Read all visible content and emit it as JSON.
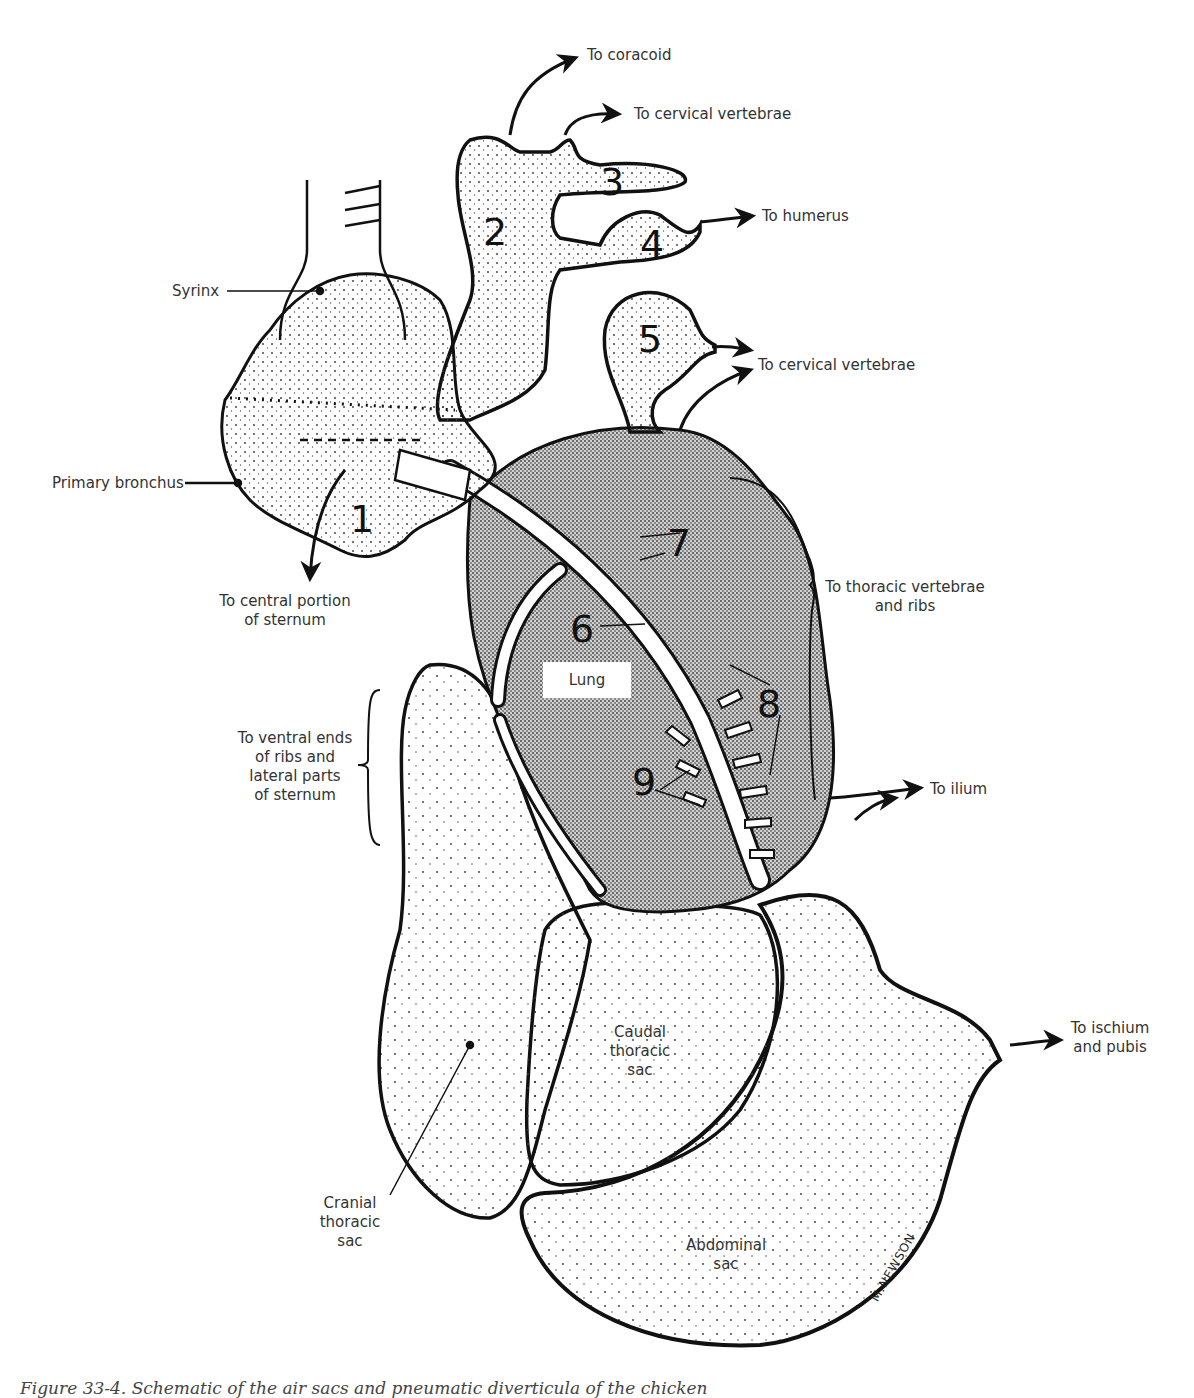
{
  "figure": {
    "caption": "Figure 33-4. Schematic of the air sacs and pneumatic diverticula of the chicken",
    "signature": "M.NEWSON"
  },
  "labels": {
    "to_coracoid": "To coracoid",
    "to_cervical_vertebrae_top": "To cervical vertebrae",
    "to_humerus": "To humerus",
    "syrinx": "Syrinx",
    "to_cervical_vertebrae_mid": "To cervical vertebrae",
    "primary_bronchus": "Primary bronchus",
    "to_central_sternum": [
      "To central portion",
      "of sternum"
    ],
    "to_thoracic_vertebrae": [
      "To thoracic vertebrae",
      "and ribs"
    ],
    "lung": "Lung",
    "to_ventral_ends": [
      "To ventral ends",
      "of ribs and",
      "lateral parts",
      "of sternum"
    ],
    "to_ilium": "To ilium",
    "to_ischium": [
      "To ischium",
      "and pubis"
    ],
    "caudal_thoracic_sac": [
      "Caudal",
      "thoracic",
      "sac"
    ],
    "cranial_thoracic_sac": [
      "Cranial",
      "thoracic",
      "sac"
    ],
    "abdominal_sac": [
      "Abdominal",
      "sac"
    ]
  },
  "numbers": {
    "n1": "1",
    "n2": "2",
    "n3": "3",
    "n4": "4",
    "n5": "5",
    "n6": "6",
    "n7": "7",
    "n8": "8",
    "n9": "9"
  },
  "colors": {
    "ink": "#111111",
    "lung_fill": "#b8b8b8",
    "sac_dots": "#444444",
    "background": "#ffffff"
  }
}
